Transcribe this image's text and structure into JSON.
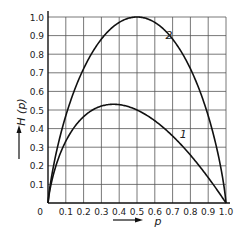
{
  "chart_data": {
    "type": "line",
    "title": "",
    "xlabel": "p",
    "ylabel": "H (p)",
    "xlim": [
      0,
      1.0
    ],
    "ylim": [
      0,
      1.0
    ],
    "grid": true,
    "x_ticks": [
      "0",
      "0.1",
      "0.2",
      "0.3",
      "0.4",
      "0.5",
      "0.6",
      "0.7",
      "0.8",
      "0.9",
      "1.0"
    ],
    "y_ticks": [
      "0.1",
      "0.2",
      "0.3",
      "0.4",
      "0.5",
      "0.6",
      "0.7",
      "0.8",
      "0.9",
      "1.0"
    ],
    "x": [
      0,
      0.02,
      0.05,
      0.1,
      0.15,
      0.2,
      0.25,
      0.3,
      0.35,
      0.368,
      0.4,
      0.45,
      0.5,
      0.55,
      0.6,
      0.65,
      0.7,
      0.75,
      0.8,
      0.85,
      0.9,
      0.95,
      0.98,
      1.0
    ],
    "series": [
      {
        "name": "1",
        "label": "1",
        "formula": "-p log2 p",
        "values": [
          0,
          0.113,
          0.216,
          0.332,
          0.411,
          0.464,
          0.5,
          0.521,
          0.53,
          0.531,
          0.529,
          0.518,
          0.5,
          0.474,
          0.442,
          0.404,
          0.36,
          0.311,
          0.258,
          0.199,
          0.137,
          0.07,
          0.029,
          0
        ]
      },
      {
        "name": "2",
        "label": "2",
        "formula": "-p log2 p - (1-p) log2 (1-p)",
        "values": [
          0,
          0.141,
          0.286,
          0.469,
          0.61,
          0.722,
          0.811,
          0.881,
          0.934,
          0.949,
          0.971,
          0.993,
          1.0,
          0.993,
          0.971,
          0.934,
          0.881,
          0.811,
          0.722,
          0.61,
          0.469,
          0.286,
          0.141,
          0
        ]
      }
    ],
    "annotations": [
      {
        "text": "1",
        "x": 0.76,
        "y": 0.35
      },
      {
        "text": "2",
        "x": 0.68,
        "y": 0.88
      }
    ],
    "legend": "inline curve labels"
  },
  "frame": {
    "left": 48,
    "right": 226,
    "top": 17,
    "bottom": 203
  }
}
